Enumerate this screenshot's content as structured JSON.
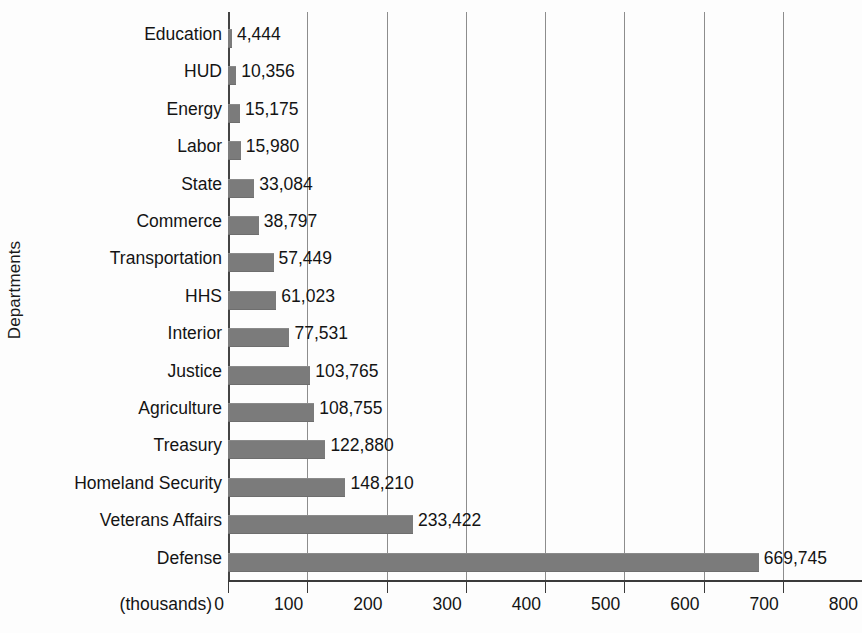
{
  "chart_data": {
    "type": "bar",
    "orientation": "horizontal",
    "title": "",
    "xlabel": "(thousands)",
    "ylabel": "Departments",
    "xlim": [
      0,
      800
    ],
    "xticks": [
      0,
      100,
      200,
      300,
      400,
      500,
      600,
      700,
      800
    ],
    "xtick_labels": [
      "0",
      "100",
      "200",
      "300",
      "400",
      "500",
      "600",
      "700",
      "800"
    ],
    "grid": true,
    "legend": false,
    "unit_note": "(thousands)",
    "categories": [
      "Education",
      "HUD",
      "Energy",
      "Labor",
      "State",
      "Commerce",
      "Transportation",
      "HHS",
      "Interior",
      "Justice",
      "Agriculture",
      "Treasury",
      "Homeland Security",
      "Veterans Affairs",
      "Defense"
    ],
    "values": [
      4444,
      10356,
      15175,
      15980,
      33084,
      38797,
      57449,
      61023,
      77531,
      103765,
      108755,
      122880,
      148210,
      233422,
      669745
    ],
    "value_labels": [
      "4,444",
      "10,356",
      "15,175",
      "15,980",
      "33,084",
      "38,797",
      "57,449",
      "61,023",
      "77,531",
      "103,765",
      "108,755",
      "122,880",
      "148,210",
      "233,422",
      "669,745"
    ],
    "bar_color": "#7b7b7b",
    "gridline_color": "#8d8d8d",
    "axis_color": "#3a3a3a",
    "background_color": "#fdfdfd"
  }
}
